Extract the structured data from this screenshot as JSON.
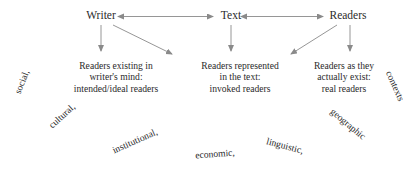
{
  "diagram": {
    "ink_color": "#2b2b2b",
    "arrow_color": "#8a8a8a",
    "background_color": "#ffffff",
    "nodes": [
      {
        "id": "writer",
        "label": "Writer",
        "x": 101,
        "y": 16
      },
      {
        "id": "text",
        "label": "Text",
        "x": 231,
        "y": 16
      },
      {
        "id": "readers",
        "label": "Readers",
        "x": 348,
        "y": 16
      }
    ],
    "descriptions": [
      {
        "id": "intended-readers",
        "x": 116,
        "y": 60,
        "lines": [
          "Readers existing in",
          "writer's mind:",
          "intended/ideal readers"
        ]
      },
      {
        "id": "invoked-readers",
        "x": 240,
        "y": 60,
        "lines": [
          "Readers represented",
          "in the text:",
          "invoked readers"
        ]
      },
      {
        "id": "real-readers",
        "x": 344,
        "y": 60,
        "lines": [
          "Readers as they",
          "actually exist:",
          "real readers"
        ]
      }
    ],
    "arc_words": [
      {
        "id": "social",
        "label": "social,",
        "x": 22,
        "y": 82,
        "rotate": -68
      },
      {
        "id": "cultural",
        "label": "cultural,",
        "x": 62,
        "y": 116,
        "rotate": -42
      },
      {
        "id": "institutional",
        "label": "institutional,",
        "x": 135,
        "y": 141,
        "rotate": -24
      },
      {
        "id": "economic",
        "label": "economic,",
        "x": 215,
        "y": 154,
        "rotate": -4
      },
      {
        "id": "linguistic",
        "label": "linguistic,",
        "x": 285,
        "y": 146,
        "rotate": 15
      },
      {
        "id": "geographic",
        "label": "geographic",
        "x": 348,
        "y": 124,
        "rotate": 40
      },
      {
        "id": "contexts",
        "label": "contexts",
        "x": 395,
        "y": 86,
        "rotate": 66
      }
    ],
    "arrows": [
      {
        "id": "writer-text",
        "kind": "bidirectional",
        "from": "writer",
        "to": "text"
      },
      {
        "id": "text-readers",
        "kind": "bidirectional",
        "from": "text",
        "to": "readers"
      },
      {
        "id": "writer-down",
        "kind": "single",
        "from": "writer",
        "to": "intended-readers"
      },
      {
        "id": "writer-diagonal",
        "kind": "single",
        "from": "writer",
        "to": "invoked-readers"
      },
      {
        "id": "text-down",
        "kind": "single",
        "from": "text",
        "to": "invoked-readers"
      },
      {
        "id": "readers-diagonal",
        "kind": "single",
        "from": "readers",
        "to": "invoked-readers"
      },
      {
        "id": "readers-down",
        "kind": "single",
        "from": "readers",
        "to": "real-readers"
      }
    ]
  }
}
